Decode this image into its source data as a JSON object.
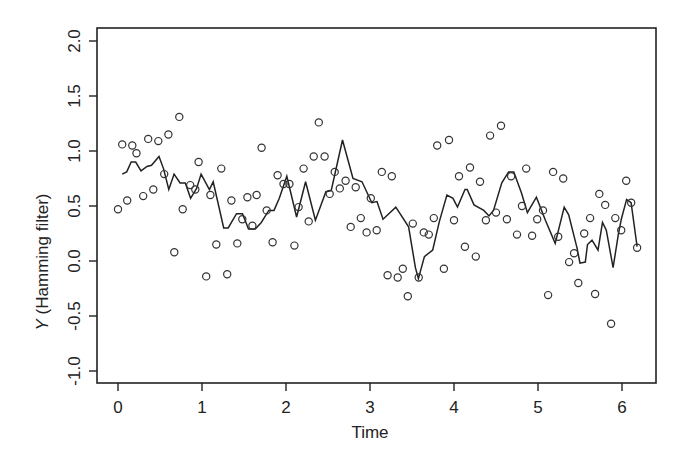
{
  "chart_data": {
    "type": "scatter",
    "title": "",
    "xlabel": "Time",
    "ylabel_italic": "Y",
    "ylabel_rest": " (Hamming filter)",
    "ylabel": "Y (Hamming filter)",
    "xlim": [
      -0.25,
      6.4
    ],
    "ylim": [
      -1.1,
      2.1
    ],
    "x_ticks": [
      0,
      1,
      2,
      3,
      4,
      5,
      6
    ],
    "x_tick_labels": [
      "0",
      "1",
      "2",
      "3",
      "4",
      "5",
      "6"
    ],
    "y_ticks": [
      -1.0,
      -0.5,
      0.0,
      0.5,
      1.0,
      1.5,
      2.0
    ],
    "y_tick_labels": [
      "-1.0",
      "-0.5",
      "0.0",
      "0.5",
      "1.0",
      "1.5",
      "2.0"
    ],
    "grid": false,
    "legend": null,
    "series": [
      {
        "name": "observations",
        "style": "open-circles",
        "color": "#333333",
        "points": [
          [
            0.0,
            0.47
          ],
          [
            0.05,
            1.06
          ],
          [
            0.11,
            0.55
          ],
          [
            0.17,
            1.05
          ],
          [
            0.22,
            0.98
          ],
          [
            0.3,
            0.59
          ],
          [
            0.36,
            1.11
          ],
          [
            0.42,
            0.65
          ],
          [
            0.48,
            1.09
          ],
          [
            0.55,
            0.79
          ],
          [
            0.6,
            1.15
          ],
          [
            0.67,
            0.08
          ],
          [
            0.73,
            1.31
          ],
          [
            0.77,
            0.47
          ],
          [
            0.86,
            0.69
          ],
          [
            0.92,
            0.65
          ],
          [
            0.96,
            0.9
          ],
          [
            1.05,
            -0.14
          ],
          [
            1.1,
            0.6
          ],
          [
            1.17,
            0.15
          ],
          [
            1.23,
            0.84
          ],
          [
            1.3,
            -0.12
          ],
          [
            1.35,
            0.55
          ],
          [
            1.42,
            0.16
          ],
          [
            1.48,
            0.38
          ],
          [
            1.54,
            0.58
          ],
          [
            1.6,
            0.32
          ],
          [
            1.65,
            0.6
          ],
          [
            1.71,
            1.03
          ],
          [
            1.77,
            0.46
          ],
          [
            1.84,
            0.17
          ],
          [
            1.9,
            0.78
          ],
          [
            1.97,
            0.7
          ],
          [
            2.04,
            0.7
          ],
          [
            2.1,
            0.14
          ],
          [
            2.15,
            0.49
          ],
          [
            2.21,
            0.84
          ],
          [
            2.27,
            0.36
          ],
          [
            2.33,
            0.95
          ],
          [
            2.39,
            1.26
          ],
          [
            2.46,
            0.95
          ],
          [
            2.52,
            0.61
          ],
          [
            2.58,
            0.81
          ],
          [
            2.64,
            0.66
          ],
          [
            2.71,
            0.73
          ],
          [
            2.77,
            0.31
          ],
          [
            2.83,
            0.67
          ],
          [
            2.89,
            0.39
          ],
          [
            2.96,
            0.26
          ],
          [
            3.01,
            0.57
          ],
          [
            3.08,
            0.28
          ],
          [
            3.14,
            0.81
          ],
          [
            3.21,
            -0.13
          ],
          [
            3.26,
            0.77
          ],
          [
            3.33,
            -0.15
          ],
          [
            3.39,
            -0.07
          ],
          [
            3.45,
            -0.32
          ],
          [
            3.51,
            0.34
          ],
          [
            3.58,
            -0.15
          ],
          [
            3.64,
            0.26
          ],
          [
            3.7,
            0.24
          ],
          [
            3.76,
            0.39
          ],
          [
            3.8,
            1.05
          ],
          [
            3.88,
            -0.07
          ],
          [
            3.94,
            1.1
          ],
          [
            4.0,
            0.37
          ],
          [
            4.06,
            0.77
          ],
          [
            4.13,
            0.13
          ],
          [
            4.19,
            0.85
          ],
          [
            4.26,
            0.04
          ],
          [
            4.31,
            0.72
          ],
          [
            4.38,
            0.37
          ],
          [
            4.43,
            1.14
          ],
          [
            4.5,
            0.44
          ],
          [
            4.56,
            1.23
          ],
          [
            4.63,
            0.38
          ],
          [
            4.68,
            0.77
          ],
          [
            4.75,
            0.24
          ],
          [
            4.81,
            0.5
          ],
          [
            4.86,
            0.84
          ],
          [
            4.93,
            0.23
          ],
          [
            4.99,
            0.38
          ],
          [
            5.06,
            0.46
          ],
          [
            5.12,
            -0.31
          ],
          [
            5.18,
            0.81
          ],
          [
            5.24,
            0.22
          ],
          [
            5.3,
            0.75
          ],
          [
            5.37,
            -0.01
          ],
          [
            5.43,
            0.07
          ],
          [
            5.48,
            -0.2
          ],
          [
            5.55,
            0.25
          ],
          [
            5.62,
            0.39
          ],
          [
            5.68,
            -0.3
          ],
          [
            5.73,
            0.61
          ],
          [
            5.8,
            0.51
          ],
          [
            5.87,
            -0.57
          ],
          [
            5.92,
            0.39
          ],
          [
            5.99,
            0.28
          ],
          [
            6.05,
            0.73
          ],
          [
            6.11,
            0.53
          ],
          [
            6.18,
            0.12
          ]
        ]
      },
      {
        "name": "Hamming filter",
        "style": "line",
        "color": "#222222",
        "points": [
          [
            0.05,
            0.79
          ],
          [
            0.11,
            0.81
          ],
          [
            0.17,
            0.9
          ],
          [
            0.23,
            0.9
          ],
          [
            0.3,
            0.82
          ],
          [
            0.38,
            0.86
          ],
          [
            0.44,
            0.87
          ],
          [
            0.54,
            0.95
          ],
          [
            0.6,
            0.84
          ],
          [
            0.67,
            0.65
          ],
          [
            0.74,
            0.79
          ],
          [
            0.82,
            0.71
          ],
          [
            0.89,
            0.71
          ],
          [
            0.96,
            0.57
          ],
          [
            1.04,
            0.66
          ],
          [
            1.1,
            0.79
          ],
          [
            1.21,
            0.65
          ],
          [
            1.26,
            0.72
          ],
          [
            1.4,
            0.3
          ],
          [
            1.46,
            0.3
          ],
          [
            1.57,
            0.43
          ],
          [
            1.65,
            0.43
          ],
          [
            1.73,
            0.29
          ],
          [
            1.82,
            0.29
          ],
          [
            1.9,
            0.35
          ],
          [
            2.0,
            0.46
          ],
          [
            2.07,
            0.46
          ],
          [
            2.14,
            0.57
          ],
          [
            2.24,
            0.77
          ],
          [
            2.37,
            0.4
          ],
          [
            2.49,
            0.72
          ],
          [
            2.62,
            0.37
          ],
          [
            2.76,
            0.63
          ],
          [
            2.83,
            0.64
          ],
          [
            2.98,
            1.1
          ],
          [
            3.12,
            0.75
          ],
          [
            3.24,
            0.72
          ],
          [
            3.37,
            0.53
          ],
          [
            3.44,
            0.54
          ],
          [
            3.52,
            0.38
          ],
          [
            3.69,
            0.49
          ],
          [
            3.86,
            0.31
          ],
          [
            3.95,
            -0.06
          ],
          [
            3.99,
            -0.16
          ],
          [
            4.07,
            0.04
          ],
          [
            4.18,
            0.1
          ],
          [
            4.27,
            0.36
          ],
          [
            4.37,
            0.6
          ],
          [
            4.45,
            0.57
          ],
          [
            4.51,
            0.49
          ],
          [
            4.61,
            0.65
          ],
          [
            4.64,
            0.65
          ],
          [
            4.73,
            0.51
          ],
          [
            4.86,
            0.46
          ],
          [
            4.93,
            0.41
          ],
          [
            4.99,
            0.46
          ],
          [
            5.1,
            0.71
          ],
          [
            5.19,
            0.81
          ],
          [
            5.26,
            0.81
          ],
          [
            5.36,
            0.62
          ],
          [
            5.44,
            0.44
          ],
          [
            5.56,
            0.58
          ],
          [
            5.68,
            0.37
          ],
          [
            5.81,
            0.16
          ],
          [
            5.93,
            0.49
          ],
          [
            5.99,
            0.42
          ],
          [
            6.1,
            0.12
          ],
          [
            6.14,
            -0.02
          ],
          [
            6.21,
            -0.01
          ],
          [
            6.24,
            0.15
          ],
          [
            6.3,
            0.19
          ],
          [
            6.38,
            0.1
          ],
          [
            6.44,
            0.35
          ],
          [
            6.49,
            0.28
          ],
          [
            6.58,
            -0.06
          ],
          [
            6.65,
            0.24
          ],
          [
            6.69,
            0.38
          ],
          [
            6.76,
            0.56
          ],
          [
            6.82,
            0.53
          ],
          [
            6.9,
            0.13
          ]
        ]
      }
    ]
  }
}
